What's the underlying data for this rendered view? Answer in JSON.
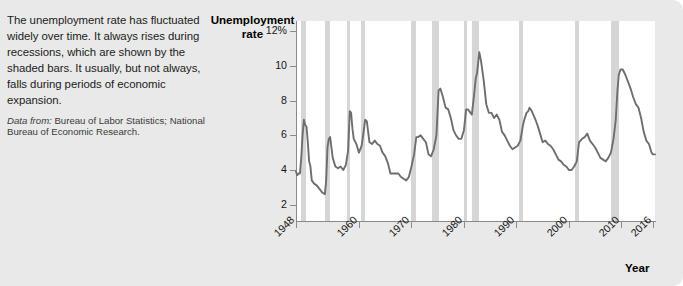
{
  "caption": {
    "body": "The unemployment rate has fluctuated widely over time. It always rises during recessions, which are shown by the shaded bars. It usually, but not always, falls during periods of economic expansion.",
    "source_label": "Data from:",
    "source_text": " Bureau of Labor Statistics; National Bureau of Economic Research."
  },
  "colors": {
    "background": "#e9e9e9",
    "plot_background": "#ffffff",
    "line": "#6e6e6e",
    "recession_bar": "#d6d6d6",
    "axis": "#8a8a8a",
    "text": "#151515"
  },
  "chart_data": {
    "type": "line",
    "title": "",
    "ylabel": "Unemployment rate",
    "xlabel": "Year",
    "ylim": [
      1,
      12.6
    ],
    "xlim": [
      1948,
      2016.4
    ],
    "grid": false,
    "legend": false,
    "y_ticks": [
      {
        "value": 12,
        "label": "12%"
      },
      {
        "value": 10,
        "label": "10"
      },
      {
        "value": 8,
        "label": "8"
      },
      {
        "value": 6,
        "label": "6"
      },
      {
        "value": 4,
        "label": "4"
      },
      {
        "value": 2,
        "label": "2"
      }
    ],
    "x_ticks": [
      {
        "value": 1948,
        "label": "1948"
      },
      {
        "value": 1960,
        "label": "1960"
      },
      {
        "value": 1970,
        "label": "1970"
      },
      {
        "value": 1980,
        "label": "1980"
      },
      {
        "value": 1990,
        "label": "1990"
      },
      {
        "value": 2000,
        "label": "2000"
      },
      {
        "value": 2010,
        "label": "2010"
      },
      {
        "value": 2016,
        "label": "2016"
      }
    ],
    "annotations": {
      "recession_bars_note": "Shaded vertical bars mark NBER recessions"
    },
    "recessions": [
      {
        "start": 1948.92,
        "end": 1949.83
      },
      {
        "start": 1953.58,
        "end": 1954.42
      },
      {
        "start": 1957.67,
        "end": 1958.33
      },
      {
        "start": 1960.33,
        "end": 1961.08
      },
      {
        "start": 1969.92,
        "end": 1970.92
      },
      {
        "start": 1973.92,
        "end": 1975.17
      },
      {
        "start": 1980.08,
        "end": 1980.58
      },
      {
        "start": 1981.58,
        "end": 1982.92
      },
      {
        "start": 1990.58,
        "end": 1991.17
      },
      {
        "start": 2001.25,
        "end": 2001.83
      },
      {
        "start": 2007.98,
        "end": 2009.5
      }
    ],
    "x": [
      1948.0,
      1948.25,
      1948.5,
      1948.75,
      1949.0,
      1949.25,
      1949.5,
      1949.75,
      1950.0,
      1950.25,
      1950.5,
      1950.75,
      1951.0,
      1951.5,
      1952.0,
      1952.5,
      1953.0,
      1953.5,
      1953.75,
      1954.0,
      1954.25,
      1954.5,
      1954.75,
      1955.0,
      1955.5,
      1956.0,
      1956.5,
      1957.0,
      1957.5,
      1957.92,
      1958.25,
      1958.5,
      1958.75,
      1959.0,
      1959.5,
      1960.0,
      1960.5,
      1960.92,
      1961.17,
      1961.5,
      1962.0,
      1962.5,
      1963.0,
      1963.5,
      1964.0,
      1964.5,
      1965.0,
      1965.5,
      1966.0,
      1966.5,
      1967.0,
      1967.5,
      1968.0,
      1968.5,
      1969.0,
      1969.5,
      1970.0,
      1970.5,
      1970.92,
      1971.25,
      1971.75,
      1972.25,
      1972.75,
      1973.25,
      1973.75,
      1974.25,
      1974.75,
      1975.17,
      1975.5,
      1975.92,
      1976.5,
      1977.0,
      1977.5,
      1978.0,
      1978.5,
      1979.0,
      1979.5,
      1980.0,
      1980.42,
      1980.75,
      1981.0,
      1981.5,
      1981.92,
      1982.25,
      1982.5,
      1982.92,
      1983.25,
      1983.75,
      1984.25,
      1984.75,
      1985.25,
      1985.75,
      1986.25,
      1986.75,
      1987.25,
      1987.75,
      1988.25,
      1988.75,
      1989.25,
      1989.75,
      1990.25,
      1990.75,
      1991.25,
      1991.5,
      1991.92,
      1992.25,
      1992.5,
      1992.92,
      1993.5,
      1994.0,
      1994.5,
      1995.0,
      1995.5,
      1996.0,
      1996.5,
      1997.0,
      1997.5,
      1998.0,
      1998.5,
      1999.0,
      1999.5,
      2000.0,
      2000.5,
      2001.0,
      2001.5,
      2001.92,
      2002.5,
      2003.0,
      2003.5,
      2004.0,
      2004.5,
      2005.0,
      2005.5,
      2006.0,
      2006.5,
      2007.0,
      2007.5,
      2008.0,
      2008.5,
      2008.92,
      2009.25,
      2009.5,
      2009.83,
      2010.25,
      2010.75,
      2011.25,
      2011.75,
      2012.25,
      2012.75,
      2013.25,
      2013.75,
      2014.25,
      2014.75,
      2015.25,
      2015.75,
      2016.0,
      2016.4
    ],
    "y": [
      3.9,
      3.7,
      3.8,
      3.8,
      4.7,
      6.0,
      6.9,
      6.6,
      6.5,
      5.6,
      4.5,
      4.2,
      3.4,
      3.2,
      3.1,
      2.9,
      2.7,
      2.6,
      3.4,
      5.3,
      5.8,
      5.9,
      5.3,
      4.7,
      4.2,
      4.1,
      4.2,
      4.0,
      4.3,
      5.1,
      7.4,
      7.3,
      6.4,
      5.8,
      5.5,
      5.0,
      5.4,
      6.3,
      6.9,
      6.8,
      5.6,
      5.5,
      5.7,
      5.5,
      5.4,
      5.0,
      4.8,
      4.4,
      3.8,
      3.8,
      3.8,
      3.8,
      3.6,
      3.5,
      3.4,
      3.6,
      4.2,
      4.9,
      5.9,
      5.9,
      6.0,
      5.8,
      5.6,
      4.9,
      4.8,
      5.2,
      6.0,
      8.6,
      8.7,
      8.3,
      7.6,
      7.5,
      7.0,
      6.3,
      6.0,
      5.8,
      5.8,
      6.3,
      7.5,
      7.5,
      7.4,
      7.2,
      8.3,
      9.3,
      9.6,
      10.8,
      10.3,
      9.2,
      7.8,
      7.3,
      7.3,
      7.0,
      7.2,
      6.9,
      6.2,
      6.0,
      5.7,
      5.4,
      5.2,
      5.3,
      5.4,
      5.7,
      6.6,
      6.9,
      7.3,
      7.4,
      7.6,
      7.4,
      7.0,
      6.6,
      6.1,
      5.6,
      5.7,
      5.5,
      5.4,
      5.2,
      4.9,
      4.6,
      4.5,
      4.3,
      4.2,
      4.0,
      4.0,
      4.2,
      4.5,
      5.6,
      5.8,
      5.9,
      6.1,
      5.7,
      5.5,
      5.3,
      5.0,
      4.7,
      4.6,
      4.5,
      4.7,
      5.0,
      5.8,
      6.9,
      8.6,
      9.5,
      9.8,
      9.8,
      9.5,
      9.1,
      8.7,
      8.2,
      7.8,
      7.6,
      7.0,
      6.2,
      5.7,
      5.5,
      5.0,
      4.9,
      4.9
    ]
  }
}
